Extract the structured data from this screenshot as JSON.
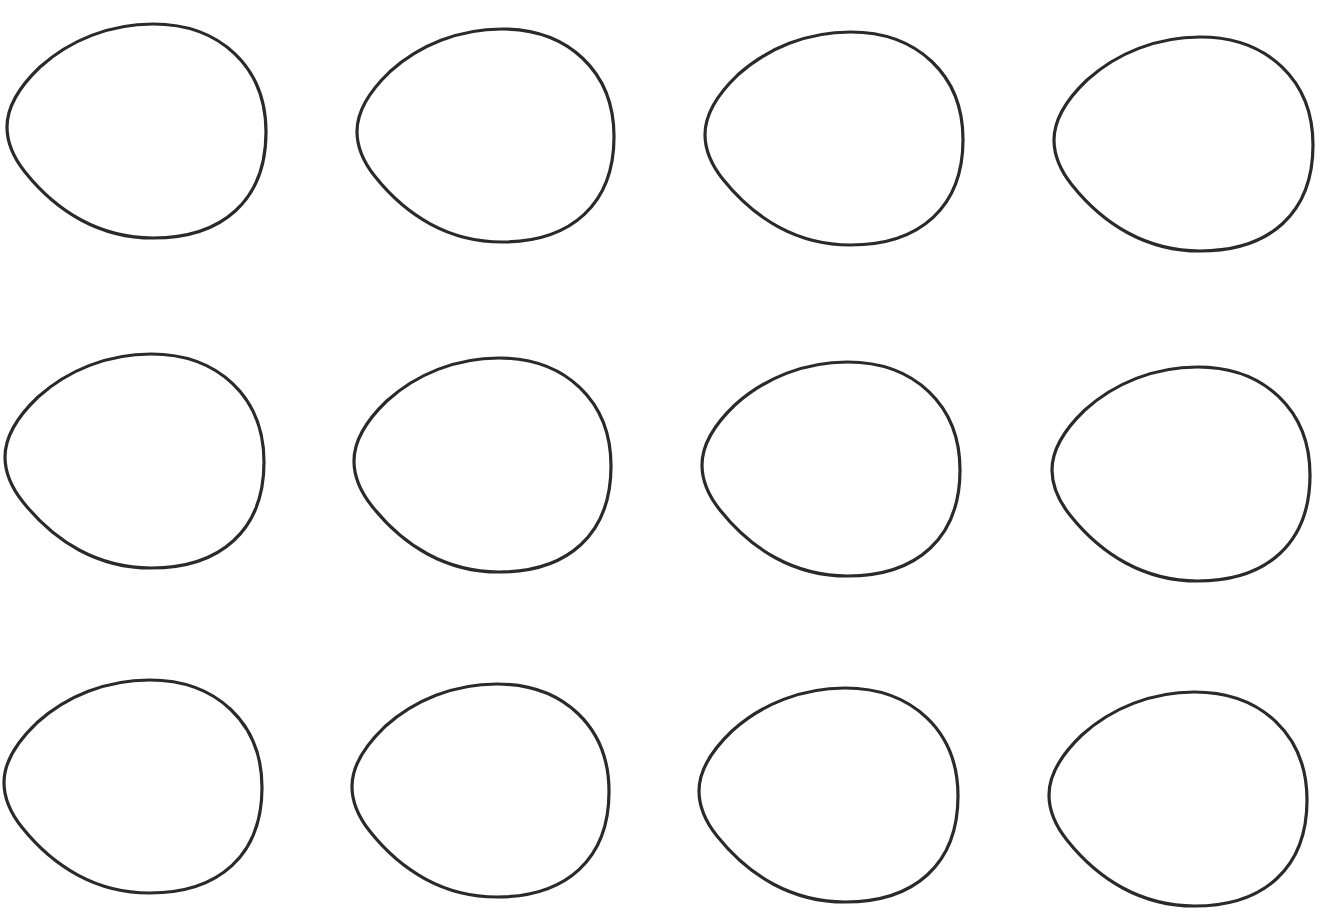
{
  "page": {
    "background": "#ffffff",
    "width": 1321,
    "height": 913
  },
  "grid": {
    "rows": 3,
    "columns": 4,
    "shape": "egg-outline",
    "stroke_color": "#2a2a2a",
    "stroke_width": 3.2,
    "fill": "none"
  },
  "eggs": [
    {
      "row": 1,
      "col": 1,
      "x": 5,
      "y": 22,
      "w": 263,
      "h": 218
    },
    {
      "row": 1,
      "col": 2,
      "x": 355,
      "y": 27,
      "w": 261,
      "h": 217
    },
    {
      "row": 1,
      "col": 3,
      "x": 703,
      "y": 30,
      "w": 262,
      "h": 217
    },
    {
      "row": 1,
      "col": 4,
      "x": 1052,
      "y": 35,
      "w": 263,
      "h": 218
    },
    {
      "row": 2,
      "col": 1,
      "x": 3,
      "y": 352,
      "w": 263,
      "h": 218
    },
    {
      "row": 2,
      "col": 2,
      "x": 352,
      "y": 356,
      "w": 261,
      "h": 218
    },
    {
      "row": 2,
      "col": 3,
      "x": 700,
      "y": 360,
      "w": 262,
      "h": 218
    },
    {
      "row": 2,
      "col": 4,
      "x": 1050,
      "y": 365,
      "w": 262,
      "h": 218
    },
    {
      "row": 3,
      "col": 1,
      "x": 2,
      "y": 678,
      "w": 262,
      "h": 217
    },
    {
      "row": 3,
      "col": 2,
      "x": 350,
      "y": 682,
      "w": 261,
      "h": 217
    },
    {
      "row": 3,
      "col": 3,
      "x": 697,
      "y": 686,
      "w": 263,
      "h": 218
    },
    {
      "row": 3,
      "col": 4,
      "x": 1047,
      "y": 690,
      "w": 262,
      "h": 218
    }
  ]
}
